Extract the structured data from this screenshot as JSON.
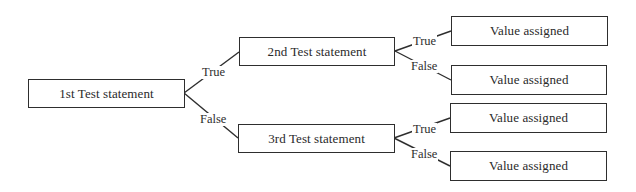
{
  "diagram": {
    "type": "decision-tree",
    "nodes": {
      "test1": "1st Test statement",
      "test2": "2nd Test statement",
      "test3": "3rd Test statement",
      "value1": "Value assigned",
      "value2": "Value assigned",
      "value3": "Value assigned",
      "value4": "Value assigned"
    },
    "edges": {
      "t1_true": "True",
      "t1_false": "False",
      "t2_true": "True",
      "t2_false": "False",
      "t3_true": "True",
      "t3_false": "False"
    },
    "colors": {
      "stroke": "#2e2e2e",
      "background": "#ffffff"
    }
  }
}
